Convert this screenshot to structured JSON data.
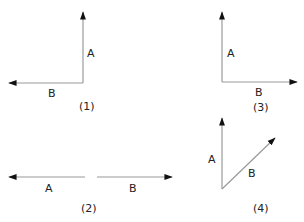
{
  "colors": {
    "line": "#9a9a9a",
    "arrow": "#111111",
    "text": "#222222"
  },
  "figures": [
    {
      "id": "1",
      "caption": "(1)",
      "vectors": [
        {
          "label": "A",
          "direction": "up"
        },
        {
          "label": "B",
          "direction": "left"
        }
      ]
    },
    {
      "id": "2",
      "caption": "(2)",
      "vectors": [
        {
          "label": "A",
          "direction": "left"
        },
        {
          "label": "B",
          "direction": "right"
        }
      ]
    },
    {
      "id": "3",
      "caption": "(3)",
      "vectors": [
        {
          "label": "A",
          "direction": "up"
        },
        {
          "label": "B",
          "direction": "right"
        }
      ]
    },
    {
      "id": "4",
      "caption": "(4)",
      "vectors": [
        {
          "label": "A",
          "direction": "up"
        },
        {
          "label": "B",
          "direction": "up-right"
        }
      ]
    }
  ]
}
